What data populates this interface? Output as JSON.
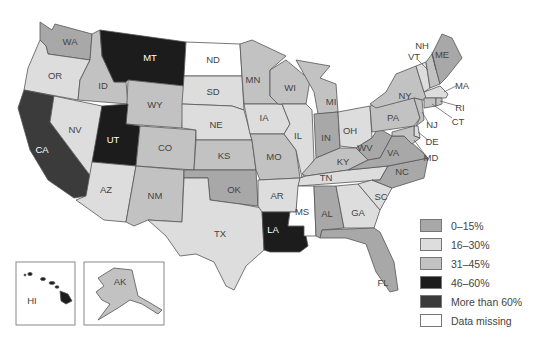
{
  "colors": {
    "0-15": "#a8a8a8",
    "16-30": "#dddddd",
    "31-45": "#c2c2c2",
    "46-60": "#1c1c1c",
    "over60": "#3b3b3b",
    "missing": "#ffffff"
  },
  "legend": [
    {
      "key": "0-15",
      "label": "0–15%"
    },
    {
      "key": "16-30",
      "label": "16–30%"
    },
    {
      "key": "31-45",
      "label": "31–45%"
    },
    {
      "key": "46-60",
      "label": "46–60%"
    },
    {
      "key": "over60",
      "label": "More than 60%"
    },
    {
      "key": "missing",
      "label": "Data missing"
    }
  ],
  "states": {
    "WA": {
      "label": "WA",
      "category": "0-15"
    },
    "OR": {
      "label": "OR",
      "category": "16-30"
    },
    "CA": {
      "label": "CA",
      "category": "over60"
    },
    "ID": {
      "label": "ID",
      "category": "31-45"
    },
    "NV": {
      "label": "NV",
      "category": "16-30"
    },
    "MT": {
      "label": "MT",
      "category": "46-60"
    },
    "WY": {
      "label": "WY",
      "category": "31-45"
    },
    "UT": {
      "label": "UT",
      "category": "46-60"
    },
    "AZ": {
      "label": "AZ",
      "category": "16-30"
    },
    "CO": {
      "label": "CO",
      "category": "31-45"
    },
    "NM": {
      "label": "NM",
      "category": "31-45"
    },
    "ND": {
      "label": "ND",
      "category": "missing"
    },
    "SD": {
      "label": "SD",
      "category": "16-30"
    },
    "NE": {
      "label": "NE",
      "category": "16-30"
    },
    "KS": {
      "label": "KS",
      "category": "31-45"
    },
    "OK": {
      "label": "OK",
      "category": "0-15"
    },
    "TX": {
      "label": "TX",
      "category": "16-30"
    },
    "MN": {
      "label": "MN",
      "category": "31-45"
    },
    "IA": {
      "label": "IA",
      "category": "16-30"
    },
    "MO": {
      "label": "MO",
      "category": "31-45"
    },
    "AR": {
      "label": "AR",
      "category": "16-30"
    },
    "LA": {
      "label": "LA",
      "category": "46-60"
    },
    "WI": {
      "label": "WI",
      "category": "31-45"
    },
    "IL": {
      "label": "IL",
      "category": "16-30"
    },
    "MS": {
      "label": "MS",
      "category": "missing"
    },
    "MI": {
      "label": "MI",
      "category": "31-45"
    },
    "IN": {
      "label": "IN",
      "category": "0-15"
    },
    "KY": {
      "label": "KY",
      "category": "31-45"
    },
    "TN": {
      "label": "TN",
      "category": "16-30"
    },
    "AL": {
      "label": "AL",
      "category": "0-15"
    },
    "OH": {
      "label": "OH",
      "category": "16-30"
    },
    "WV": {
      "label": "WV",
      "category": "0-15"
    },
    "GA": {
      "label": "GA",
      "category": "16-30"
    },
    "FL": {
      "label": "FL",
      "category": "0-15"
    },
    "SC": {
      "label": "SC",
      "category": "16-30"
    },
    "NC": {
      "label": "NC",
      "category": "0-15"
    },
    "VA": {
      "label": "VA",
      "category": "0-15"
    },
    "PA": {
      "label": "PA",
      "category": "31-45"
    },
    "NY": {
      "label": "NY",
      "category": "31-45"
    },
    "VT": {
      "label": "VT",
      "category": "16-30"
    },
    "NH": {
      "label": "NH",
      "category": "31-45"
    },
    "ME": {
      "label": "ME",
      "category": "0-15"
    },
    "MA": {
      "label": "MA",
      "category": "16-30"
    },
    "RI": {
      "label": "RI",
      "category": "31-45"
    },
    "CT": {
      "label": "CT",
      "category": "31-45"
    },
    "NJ": {
      "label": "NJ",
      "category": "31-45"
    },
    "DE": {
      "label": "DE",
      "category": "16-30"
    },
    "MD": {
      "label": "MD",
      "category": "31-45"
    },
    "HI": {
      "label": "HI",
      "category": "46-60"
    },
    "AK": {
      "label": "AK",
      "category": "31-45"
    }
  }
}
